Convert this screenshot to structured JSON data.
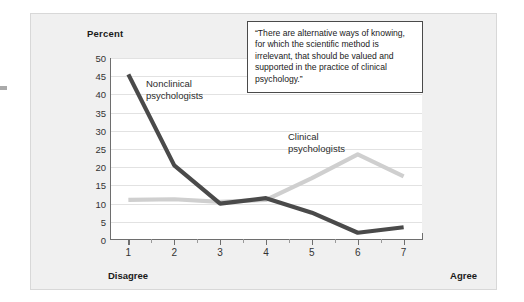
{
  "chart_data": {
    "type": "line",
    "title": "",
    "xlabel": "",
    "ylabel": "Percent",
    "x": [
      1,
      2,
      3,
      4,
      5,
      6,
      7
    ],
    "categories": [
      "1",
      "2",
      "3",
      "4",
      "5",
      "6",
      "7"
    ],
    "xlim": [
      0.6,
      7.4
    ],
    "ylim": [
      0,
      50
    ],
    "ytick_labels": [
      "50",
      "45",
      "40",
      "35",
      "30",
      "25",
      "20",
      "15",
      "10",
      "5",
      "0"
    ],
    "ytick_values": [
      50,
      45,
      40,
      35,
      30,
      25,
      20,
      15,
      10,
      5,
      0
    ],
    "grid": true,
    "legend_position": "inline-annotations",
    "x_axis_endpoints": {
      "low": "Disagree",
      "high": "Agree"
    },
    "series": [
      {
        "name": "Nonclinical psychologists",
        "label_text": "Nonclinical\npsychologists",
        "color": "#4a4a4a",
        "values": [
          45.5,
          20.5,
          10.0,
          11.5,
          7.5,
          2.0,
          3.5
        ]
      },
      {
        "name": "Clinical psychologists",
        "label_text": "Clinical\npsychologists",
        "color": "#cfcfcf",
        "values": [
          11.0,
          11.2,
          10.5,
          11.0,
          17.0,
          23.5,
          17.5
        ]
      }
    ],
    "annotations": [
      {
        "name": "survey-item-quote",
        "text": "“There are alternative ways of knowing, for which the scientific method is irrelevant, that should be valued and supported in the practice of clinical psychology.”"
      }
    ]
  },
  "axis": {
    "y_title": "Percent"
  },
  "colors": {
    "panel_background": "#f0f0f0",
    "plot_background": "#ffffff",
    "gridline": "#e2e2e2",
    "axis": "#6e6e6e",
    "nonclinical": "#4a4a4a",
    "clinical": "#cfcfcf",
    "quote_border": "#4a4a4a"
  }
}
